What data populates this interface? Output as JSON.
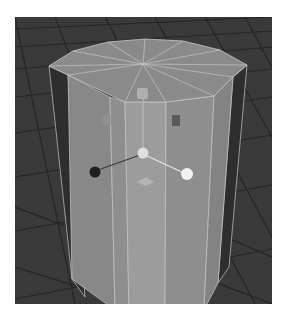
{
  "viewport": {
    "label": "3D viewport - perspective",
    "background_color": "#3a3a3a",
    "grid_line_color": "#2a2a2a"
  },
  "object": {
    "type": "cylinder",
    "subdivisions_axis": 12,
    "selected": true,
    "face_colors": {
      "top": "#8a8a8a",
      "front_center": "#9a9a9a",
      "front_side": "#8c8c8c",
      "dark_side": "#2e2e2e",
      "edge": "#c8c8c8"
    }
  },
  "manipulator": {
    "center_handle_color": "#e0e0e0",
    "y_handle_color": "#b0b0b0",
    "x_handle_color": "#f2f2f2",
    "z_handle_color": "#1e1e1e",
    "plane_handle_color": "#b4b4b4"
  }
}
